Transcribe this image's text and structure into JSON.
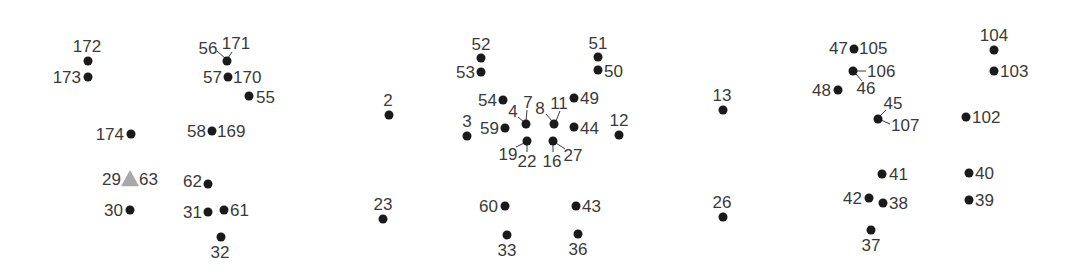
{
  "diagram": {
    "type": "landmark-point-map",
    "marker_color": "#1a1a1a",
    "highlight_color": "#a9a9a9",
    "label_color": "#3a3a3a",
    "points": [
      {
        "id": "p172",
        "label": "172",
        "x": 88,
        "y": 61,
        "shape": "dot",
        "lx": 87,
        "ly": 52,
        "anchor": "middle"
      },
      {
        "id": "p173",
        "label": "173",
        "x": 88,
        "y": 77,
        "shape": "dot",
        "lx": 81,
        "ly": 83,
        "anchor": "end"
      },
      {
        "id": "p56_171",
        "label": "56",
        "x": 227,
        "y": 61,
        "shape": "dot",
        "lx": 208,
        "ly": 54,
        "anchor": "middle",
        "leader": [
          217,
          51,
          225,
          58
        ]
      },
      {
        "id": "p171",
        "label": "171",
        "x": 227,
        "y": 61,
        "shape": "none",
        "lx": 236,
        "ly": 49,
        "anchor": "middle",
        "leader": [
          232,
          52,
          228,
          58
        ]
      },
      {
        "id": "p57_170",
        "label": "57",
        "x": 228,
        "y": 77,
        "shape": "dot",
        "lx": 222,
        "ly": 83,
        "anchor": "end"
      },
      {
        "id": "p170",
        "label": "170",
        "x": 228,
        "y": 77,
        "shape": "none",
        "lx": 233,
        "ly": 83,
        "anchor": "start"
      },
      {
        "id": "p55",
        "label": "55",
        "x": 249,
        "y": 96,
        "shape": "dot",
        "lx": 256,
        "ly": 103,
        "anchor": "start"
      },
      {
        "id": "p174",
        "label": "174",
        "x": 131,
        "y": 134,
        "shape": "dot",
        "lx": 124,
        "ly": 140,
        "anchor": "end"
      },
      {
        "id": "p58_169",
        "label": "58",
        "x": 212,
        "y": 131,
        "shape": "dot",
        "lx": 206,
        "ly": 137,
        "anchor": "end"
      },
      {
        "id": "p169",
        "label": "169",
        "x": 212,
        "y": 131,
        "shape": "none",
        "lx": 217,
        "ly": 137,
        "anchor": "start"
      },
      {
        "id": "p29_63",
        "label": "29",
        "x": 130,
        "y": 179,
        "shape": "triangle",
        "lx": 121,
        "ly": 185,
        "anchor": "end"
      },
      {
        "id": "p63",
        "label": "63",
        "x": 130,
        "y": 179,
        "shape": "none",
        "lx": 139,
        "ly": 185,
        "anchor": "start"
      },
      {
        "id": "p30",
        "label": "30",
        "x": 130,
        "y": 210,
        "shape": "dot",
        "lx": 123,
        "ly": 216,
        "anchor": "end"
      },
      {
        "id": "p62",
        "label": "62",
        "x": 208,
        "y": 184,
        "shape": "dot",
        "lx": 202,
        "ly": 187,
        "anchor": "end"
      },
      {
        "id": "p31",
        "label": "31",
        "x": 208,
        "y": 212,
        "shape": "dot",
        "lx": 202,
        "ly": 218,
        "anchor": "end"
      },
      {
        "id": "p61",
        "label": "61",
        "x": 224,
        "y": 210,
        "shape": "dot",
        "lx": 230,
        "ly": 216,
        "anchor": "start"
      },
      {
        "id": "p32",
        "label": "32",
        "x": 221,
        "y": 237,
        "shape": "dot",
        "lx": 220,
        "ly": 258,
        "anchor": "middle"
      },
      {
        "id": "p2",
        "label": "2",
        "x": 389,
        "y": 115,
        "shape": "dot",
        "lx": 388,
        "ly": 106,
        "anchor": "middle"
      },
      {
        "id": "p3",
        "label": "3",
        "x": 467,
        "y": 136,
        "shape": "dot",
        "lx": 467,
        "ly": 127,
        "anchor": "middle"
      },
      {
        "id": "p23",
        "label": "23",
        "x": 383,
        "y": 219,
        "shape": "dot",
        "lx": 383,
        "ly": 210,
        "anchor": "middle"
      },
      {
        "id": "p52",
        "label": "52",
        "x": 481,
        "y": 58,
        "shape": "dot",
        "lx": 481,
        "ly": 50,
        "anchor": "middle"
      },
      {
        "id": "p53",
        "label": "53",
        "x": 481,
        "y": 72,
        "shape": "dot",
        "lx": 475,
        "ly": 78,
        "anchor": "end"
      },
      {
        "id": "p51",
        "label": "51",
        "x": 598,
        "y": 57,
        "shape": "dot",
        "lx": 598,
        "ly": 49,
        "anchor": "middle"
      },
      {
        "id": "p50",
        "label": "50",
        "x": 598,
        "y": 70,
        "shape": "dot",
        "lx": 604,
        "ly": 77,
        "anchor": "start"
      },
      {
        "id": "p54",
        "label": "54",
        "x": 503,
        "y": 100,
        "shape": "dot",
        "lx": 497,
        "ly": 106,
        "anchor": "end"
      },
      {
        "id": "p49",
        "label": "49",
        "x": 574,
        "y": 98,
        "shape": "dot",
        "lx": 580,
        "ly": 104,
        "anchor": "start"
      },
      {
        "id": "p59",
        "label": "59",
        "x": 505,
        "y": 128,
        "shape": "dot",
        "lx": 499,
        "ly": 134,
        "anchor": "end"
      },
      {
        "id": "p4",
        "label": "4",
        "x": 526,
        "y": 124,
        "shape": "dot",
        "lx": 513,
        "ly": 117,
        "anchor": "middle",
        "leader": [
          518,
          117,
          524,
          122
        ]
      },
      {
        "id": "p7",
        "label": "7",
        "x": 526,
        "y": 124,
        "shape": "none",
        "lx": 528,
        "ly": 108,
        "anchor": "middle",
        "leader": [
          527,
          110,
          526,
          121
        ]
      },
      {
        "id": "p8",
        "label": "8",
        "x": 554,
        "y": 124,
        "shape": "dot",
        "lx": 540,
        "ly": 114,
        "anchor": "middle",
        "leader": [
          546,
          114,
          552,
          121
        ]
      },
      {
        "id": "p11",
        "label": "11",
        "x": 554,
        "y": 124,
        "shape": "none",
        "lx": 559,
        "ly": 109,
        "anchor": "middle",
        "leader": [
          560,
          111,
          556,
          121
        ]
      },
      {
        "id": "p44",
        "label": "44",
        "x": 574,
        "y": 127,
        "shape": "dot",
        "lx": 580,
        "ly": 134,
        "anchor": "start"
      },
      {
        "id": "p12",
        "label": "12",
        "x": 619,
        "y": 135,
        "shape": "dot",
        "lx": 619,
        "ly": 126,
        "anchor": "middle"
      },
      {
        "id": "p19",
        "label": "19",
        "x": 527,
        "y": 141,
        "shape": "dot",
        "lx": 508,
        "ly": 160,
        "anchor": "middle",
        "leader": [
          516,
          147,
          524,
          143
        ]
      },
      {
        "id": "p22",
        "label": "22",
        "x": 527,
        "y": 141,
        "shape": "none",
        "lx": 527,
        "ly": 167,
        "anchor": "middle",
        "leader": [
          527,
          152,
          527,
          144
        ]
      },
      {
        "id": "p16",
        "label": "16",
        "x": 553,
        "y": 141,
        "shape": "dot",
        "lx": 552,
        "ly": 167,
        "anchor": "middle",
        "leader": [
          553,
          152,
          553,
          144
        ]
      },
      {
        "id": "p27",
        "label": "27",
        "x": 553,
        "y": 141,
        "shape": "none",
        "lx": 573,
        "ly": 161,
        "anchor": "middle",
        "leader": [
          565,
          149,
          556,
          143
        ]
      },
      {
        "id": "p60",
        "label": "60",
        "x": 505,
        "y": 206,
        "shape": "dot",
        "lx": 498,
        "ly": 212,
        "anchor": "end"
      },
      {
        "id": "p43",
        "label": "43",
        "x": 576,
        "y": 206,
        "shape": "dot",
        "lx": 582,
        "ly": 212,
        "anchor": "start"
      },
      {
        "id": "p33",
        "label": "33",
        "x": 507,
        "y": 235,
        "shape": "dot",
        "lx": 507,
        "ly": 256,
        "anchor": "middle"
      },
      {
        "id": "p36",
        "label": "36",
        "x": 578,
        "y": 234,
        "shape": "dot",
        "lx": 578,
        "ly": 255,
        "anchor": "middle"
      },
      {
        "id": "p13",
        "label": "13",
        "x": 723,
        "y": 110,
        "shape": "dot",
        "lx": 722,
        "ly": 101,
        "anchor": "middle"
      },
      {
        "id": "p26",
        "label": "26",
        "x": 723,
        "y": 217,
        "shape": "dot",
        "lx": 722,
        "ly": 208,
        "anchor": "middle"
      },
      {
        "id": "p47",
        "label": "47",
        "x": 854,
        "y": 49,
        "shape": "dot",
        "lx": 848,
        "ly": 54,
        "anchor": "end"
      },
      {
        "id": "p105",
        "label": "105",
        "x": 854,
        "y": 49,
        "shape": "none",
        "lx": 859,
        "ly": 54,
        "anchor": "start"
      },
      {
        "id": "p106",
        "label": "106",
        "x": 853,
        "y": 71,
        "shape": "dot",
        "lx": 867,
        "ly": 77,
        "anchor": "start",
        "leader": [
          857,
          71,
          866,
          71
        ]
      },
      {
        "id": "p46",
        "label": "46",
        "x": 853,
        "y": 71,
        "shape": "none",
        "lx": 866,
        "ly": 94,
        "anchor": "middle",
        "leader": [
          856,
          74,
          862,
          81
        ]
      },
      {
        "id": "p48",
        "label": "48",
        "x": 838,
        "y": 90,
        "shape": "dot",
        "lx": 831,
        "ly": 96,
        "anchor": "end"
      },
      {
        "id": "p45",
        "label": "45",
        "x": 878,
        "y": 119,
        "shape": "dot",
        "lx": 893,
        "ly": 109,
        "anchor": "middle",
        "leader": [
          886,
          110,
          880,
          116
        ]
      },
      {
        "id": "p107",
        "label": "107",
        "x": 878,
        "y": 119,
        "shape": "none",
        "lx": 891,
        "ly": 131,
        "anchor": "start",
        "leader": [
          881,
          120,
          890,
          124
        ]
      },
      {
        "id": "p104",
        "label": "104",
        "x": 994,
        "y": 50,
        "shape": "dot",
        "lx": 994,
        "ly": 41,
        "anchor": "middle"
      },
      {
        "id": "p103",
        "label": "103",
        "x": 994,
        "y": 71,
        "shape": "dot",
        "lx": 1000,
        "ly": 77,
        "anchor": "start"
      },
      {
        "id": "p102",
        "label": "102",
        "x": 966,
        "y": 117,
        "shape": "dot",
        "lx": 972,
        "ly": 123,
        "anchor": "start"
      },
      {
        "id": "p41",
        "label": "41",
        "x": 882,
        "y": 174,
        "shape": "dot",
        "lx": 889,
        "ly": 180,
        "anchor": "start"
      },
      {
        "id": "p40",
        "label": "40",
        "x": 969,
        "y": 173,
        "shape": "dot",
        "lx": 975,
        "ly": 179,
        "anchor": "start"
      },
      {
        "id": "p42",
        "label": "42",
        "x": 869,
        "y": 198,
        "shape": "dot",
        "lx": 862,
        "ly": 204,
        "anchor": "end"
      },
      {
        "id": "p38",
        "label": "38",
        "x": 883,
        "y": 203,
        "shape": "dot",
        "lx": 889,
        "ly": 209,
        "anchor": "start"
      },
      {
        "id": "p39",
        "label": "39",
        "x": 969,
        "y": 200,
        "shape": "dot",
        "lx": 975,
        "ly": 206,
        "anchor": "start"
      },
      {
        "id": "p37",
        "label": "37",
        "x": 871,
        "y": 230,
        "shape": "dot",
        "lx": 871,
        "ly": 251,
        "anchor": "middle"
      }
    ]
  }
}
